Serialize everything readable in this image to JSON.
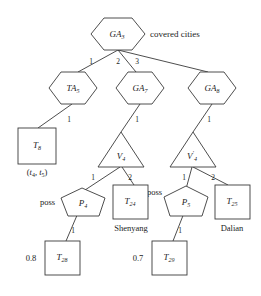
{
  "diagram": {
    "title_note": "covered cities",
    "nodes": {
      "root": {
        "base": "GA",
        "sub": "3",
        "shape": "hexagon"
      },
      "ta5": {
        "base": "TA",
        "sub": "5",
        "shape": "hexagon"
      },
      "ga7": {
        "base": "GA",
        "sub": "7",
        "shape": "hexagon"
      },
      "ga8": {
        "base": "GA",
        "sub": "8",
        "shape": "hexagon"
      },
      "t8": {
        "base": "T",
        "sub": "8",
        "shape": "rectangle",
        "caption": "(t4, t5)"
      },
      "v4": {
        "base": "V",
        "sub": "4",
        "sup": "",
        "shape": "triangle"
      },
      "v4p": {
        "base": "V",
        "sub": "4",
        "sup": "'",
        "shape": "triangle"
      },
      "p4": {
        "base": "P",
        "sub": "4",
        "shape": "pentagon",
        "tag": "poss"
      },
      "p5": {
        "base": "P",
        "sub": "5",
        "shape": "pentagon",
        "tag": "poss"
      },
      "t24": {
        "base": "T",
        "sub": "24",
        "shape": "rectangle",
        "caption": "Shenyang"
      },
      "t25": {
        "base": "T",
        "sub": "25",
        "shape": "rectangle",
        "caption": "Dalian"
      },
      "t28": {
        "base": "T",
        "sub": "28",
        "shape": "rectangle",
        "weight": "0.8"
      },
      "t29": {
        "base": "T",
        "sub": "29",
        "shape": "rectangle",
        "weight": "0.7"
      }
    },
    "edge_labels": {
      "root_ta5": "1",
      "root_ga7": "2",
      "root_ga8": "3",
      "ta5_t8": "1",
      "ga7_v4": "1",
      "ga8_v4p": "1",
      "v4_p4": "1",
      "v4_t24": "2",
      "v4p_p5": "1",
      "v4p_t25": "2",
      "p4_t28": "1",
      "p5_t29": "1"
    },
    "caption_parts": {
      "t8_open": "(",
      "t8_t": "t",
      "t8_sub1": "4",
      "t8_comma": ", ",
      "t8_t2": "t",
      "t8_sub2": "5",
      "t8_close": ")"
    }
  }
}
